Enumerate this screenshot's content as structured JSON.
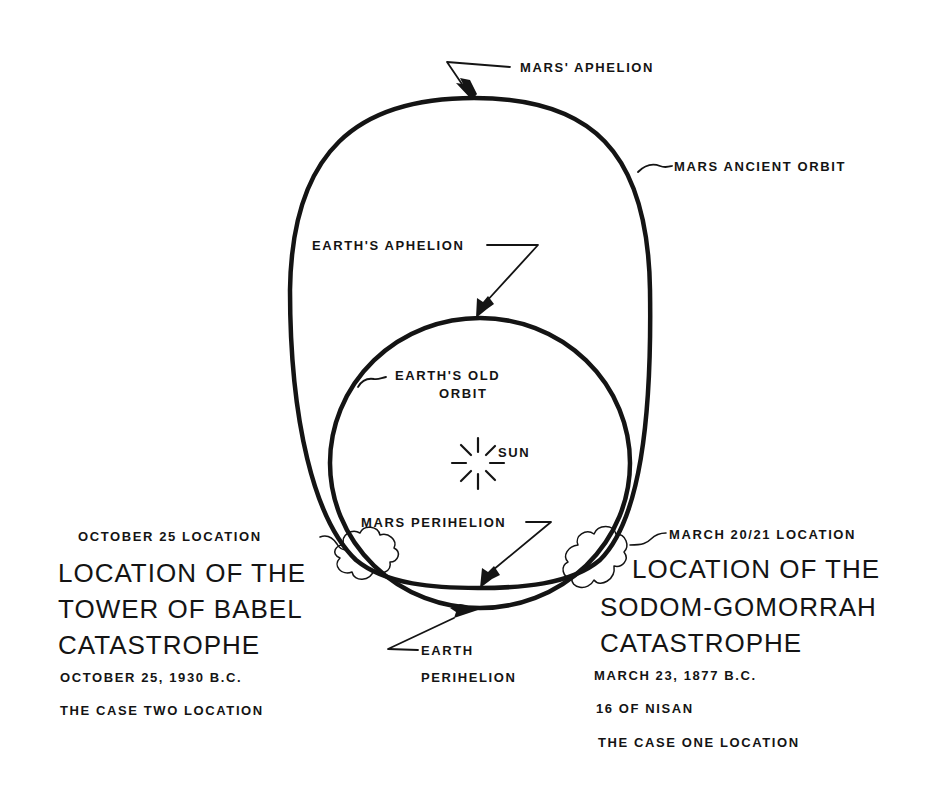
{
  "diagram": {
    "colors": {
      "ink": "#141414",
      "background": "#ffffff"
    },
    "labels": {
      "mars_aphelion": "MARS' APHELION",
      "mars_ancient_orbit": "MARS ANCIENT ORBIT",
      "earths_aphelion": "EARTH'S APHELION",
      "earths_old_orbit_line1": "EARTH'S OLD",
      "earths_old_orbit_line2": "ORBIT",
      "sun": "SUN",
      "mars_perihelion": "MARS PERIHELION",
      "earth_perihelion_line1": "EARTH",
      "earth_perihelion_line2": "PERIHELION"
    },
    "left_block": {
      "pointer_label": "OCTOBER 25 LOCATION",
      "heading": [
        "LOCATION OF THE",
        "TOWER OF BABEL",
        "CATASTROPHE"
      ],
      "date": "OCTOBER 25, 1930 B.C.",
      "case": "THE CASE TWO LOCATION"
    },
    "right_block": {
      "pointer_label": "MARCH 20/21 LOCATION",
      "heading": [
        "LOCATION OF THE",
        "SODOM-GOMORRAH",
        "CATASTROPHE"
      ],
      "date": "MARCH 23, 1877 B.C.",
      "nisan": "16 OF NISAN",
      "case": "THE CASE ONE LOCATION"
    },
    "icons": [
      "sun-icon",
      "cloud-icon",
      "arrow-icon"
    ]
  }
}
